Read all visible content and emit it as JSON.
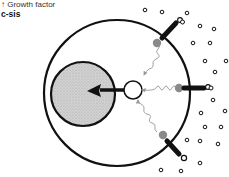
{
  "labels": {
    "growth_factor": "↑ Growth factor",
    "c_sis": "c-sis"
  },
  "diagram": {
    "type": "cell-signaling-schematic",
    "elements": {
      "cell_membrane": "outer circle",
      "nucleus": "stippled gray circle",
      "signal_transducer": "small open circle",
      "receptors": 3,
      "ligand_dots": "small open circles outside cell"
    },
    "colors": {
      "stroke": "#111111",
      "nucleus_fill": "#c8c8c8",
      "receptor_ball": "#8a8a8a",
      "wavy_signal": "#999999"
    }
  }
}
